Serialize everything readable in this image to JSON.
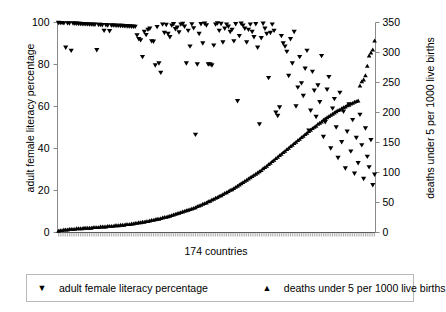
{
  "chart_data": {
    "type": "scatter",
    "title": "",
    "xlabel": "174 countries",
    "ylabel": "adult female literacy percentage",
    "y2label": "deaths under 5 per 1000 live births",
    "xlim": [
      0,
      174
    ],
    "ylim": [
      0,
      100
    ],
    "y2lim": [
      0,
      350
    ],
    "grid": false,
    "legend_position": "bottom",
    "x_tick_labels": [],
    "x_tick_count": 174,
    "y_ticks": [
      0,
      20,
      40,
      60,
      80,
      100
    ],
    "y2_ticks": [
      0,
      50,
      100,
      150,
      200,
      250,
      300,
      350
    ],
    "series": [
      {
        "name": "adult female literacy percentage",
        "axis": "left",
        "marker": "triangle-down",
        "color": "#000000",
        "values": [
          99.8,
          99.7,
          99.7,
          99.6,
          88.0,
          99.6,
          99.5,
          86.5,
          99.5,
          99.4,
          99.4,
          99.3,
          99.3,
          99.2,
          99.2,
          99.1,
          99.1,
          99.0,
          99.0,
          98.9,
          98.9,
          86.8,
          98.8,
          98.8,
          98.7,
          96.0,
          98.7,
          98.6,
          95.8,
          98.6,
          98.5,
          98.5,
          98.4,
          98.4,
          98.3,
          98.3,
          98.2,
          98.2,
          98.1,
          98.1,
          98.0,
          98.0,
          97.9,
          93.8,
          92.0,
          91.5,
          83.5,
          95.5,
          94.0,
          96.5,
          97.0,
          91.0,
          90.8,
          79.5,
          97.8,
          80.5,
          76.0,
          99.0,
          95.0,
          98.8,
          94.5,
          93.0,
          98.5,
          99.2,
          96.8,
          97.5,
          95.2,
          99.0,
          99.3,
          98.0,
          80.5,
          96.0,
          88.5,
          99.1,
          97.2,
          46.5,
          80.0,
          94.5,
          99.2,
          90.0,
          99.4,
          98.6,
          80.0,
          80.0,
          79.5,
          89.0,
          99.0,
          99.5,
          96.0,
          99.3,
          90.5,
          97.0,
          99.0,
          98.0,
          95.5,
          96.5,
          91.0,
          99.2,
          62.5,
          93.5,
          99.4,
          98.5,
          97.0,
          90.5,
          96.5,
          99.0,
          95.5,
          93.0,
          99.2,
          88.0,
          51.5,
          92.5,
          99.4,
          97.0,
          94.5,
          73.5,
          95.0,
          99.0,
          96.0,
          57.0,
          55.5,
          59.5,
          93.5,
          90.0,
          88.5,
          86.0,
          74.5,
          92.0,
          80.5,
          95.5,
          60.0,
          69.0,
          83.5,
          71.0,
          65.0,
          78.0,
          86.5,
          48.5,
          58.0,
          76.5,
          67.5,
          55.0,
          70.0,
          62.0,
          84.0,
          45.5,
          52.5,
          68.0,
          74.0,
          40.0,
          59.0,
          63.5,
          50.0,
          35.5,
          66.5,
          43.0,
          57.5,
          30.5,
          48.0,
          61.0,
          38.5,
          53.5,
          28.0,
          45.0,
          33.0,
          56.0,
          41.5,
          25.5,
          49.5,
          36.0,
          31.0,
          44.0,
          22.5,
          27.5
        ]
      },
      {
        "name": "deaths under 5 per 1000 live births",
        "axis": "right",
        "marker": "triangle-up",
        "color": "#000000",
        "values": [
          3,
          4,
          4,
          5,
          5,
          5,
          6,
          6,
          6,
          6,
          7,
          7,
          7,
          7,
          8,
          8,
          8,
          8,
          8,
          9,
          9,
          9,
          9,
          10,
          10,
          10,
          10,
          11,
          11,
          11,
          11,
          12,
          12,
          12,
          13,
          13,
          13,
          14,
          14,
          14,
          15,
          15,
          16,
          16,
          17,
          17,
          18,
          18,
          19,
          19,
          20,
          21,
          21,
          22,
          23,
          23,
          24,
          25,
          26,
          26,
          27,
          28,
          29,
          30,
          31,
          32,
          33,
          34,
          35,
          36,
          37,
          38,
          39,
          40,
          41,
          42,
          44,
          45,
          46,
          48,
          49,
          50,
          52,
          53,
          55,
          56,
          58,
          59,
          61,
          62,
          64,
          66,
          67,
          69,
          71,
          72,
          74,
          76,
          78,
          80,
          82,
          84,
          86,
          88,
          90,
          92,
          94,
          96,
          98,
          100,
          102,
          104,
          107,
          109,
          111,
          114,
          116,
          119,
          121,
          124,
          126,
          129,
          131,
          134,
          136,
          139,
          141,
          144,
          146,
          149,
          151,
          154,
          156,
          159,
          161,
          164,
          166,
          169,
          171,
          174,
          176,
          178,
          181,
          183,
          185,
          188,
          190,
          192,
          194,
          196,
          198,
          200,
          202,
          204,
          205,
          207,
          209,
          210,
          212,
          213,
          215,
          216,
          218,
          219,
          220,
          245,
          252,
          255,
          262,
          278,
          295,
          300,
          305,
          320
        ]
      }
    ]
  }
}
